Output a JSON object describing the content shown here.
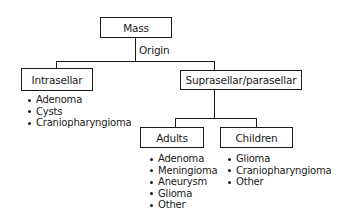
{
  "root": {
    "label": "Mass"
  },
  "edge_label": "Origin",
  "branches": [
    {
      "label": "Intrasellar",
      "items": [
        "Adenoma",
        "Cysts",
        "Craniopharyngioma"
      ]
    },
    {
      "label": "Suprasellar/parasellar",
      "children": [
        {
          "label": "Adults",
          "items": [
            "Adenoma",
            "Meningioma",
            "Aneurysm",
            "Glioma",
            "Other"
          ]
        },
        {
          "label": "Children",
          "items": [
            "Glioma",
            "Craniopharyngioma",
            "Other"
          ]
        }
      ]
    }
  ]
}
